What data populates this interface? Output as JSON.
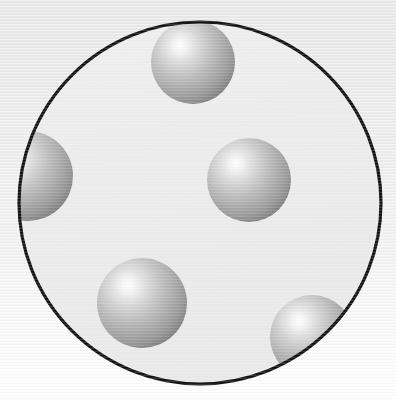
{
  "image": {
    "title": "Spheres Inside a Circular Container",
    "width": 396,
    "height": 401,
    "description": "Cross-section illustration: a large black-outlined circle filled with light gray, containing five shaded gray spheres."
  },
  "background": {
    "name": "background-gradient",
    "top_color": "#e9e9e9",
    "mid_color": "#f2f2f2",
    "bottom_color": "#ffffff",
    "texture": "faint horizontal scan lines"
  },
  "container": {
    "name": "container-circle",
    "shape": "circle",
    "cx": 200,
    "cy": 203,
    "r": 181,
    "fill": "#ececec",
    "stroke": "#111111",
    "stroke_width": 3.2
  },
  "sphere_style": {
    "highlight_color": "#fbfbfb",
    "mid_color": "#b4b4b4",
    "edge_color": "#6f6f6f",
    "rim_color": "#5c5c5c",
    "highlight_offset_x": -0.28,
    "highlight_offset_y": -0.32
  },
  "spheres": [
    {
      "name": "sphere-top",
      "label": "Top sphere",
      "cx": 193,
      "cy": 62,
      "r": 42,
      "clipped": true,
      "clipped_by": "container-circle"
    },
    {
      "name": "sphere-left",
      "label": "Left sphere",
      "cx": 28,
      "cy": 176,
      "r": 45,
      "clipped": true,
      "clipped_by": "container-circle"
    },
    {
      "name": "sphere-center",
      "label": "Center sphere",
      "cx": 249,
      "cy": 180,
      "r": 42,
      "clipped": false,
      "clipped_by": ""
    },
    {
      "name": "sphere-bottom-left",
      "label": "Bottom-left sphere",
      "cx": 142,
      "cy": 303,
      "r": 45,
      "clipped": false,
      "clipped_by": ""
    },
    {
      "name": "sphere-bottom-right",
      "label": "Bottom-right sphere",
      "cx": 312,
      "cy": 337,
      "r": 42,
      "clipped": true,
      "clipped_by": "container-circle"
    }
  ],
  "counts": {
    "sphere_count": 5
  }
}
